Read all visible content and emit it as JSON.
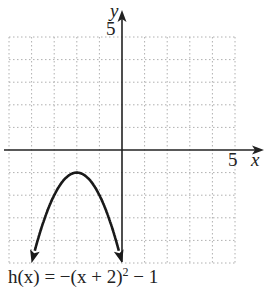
{
  "chart_data": {
    "type": "line",
    "title": "",
    "function_label": "h(x) = −(x + 2)² − 1",
    "xlabel": "x",
    "ylabel": "y",
    "xlim": [
      -5,
      5
    ],
    "ylim": [
      -5,
      5
    ],
    "x_tick_labels": [
      "5"
    ],
    "y_tick_labels": [
      "5"
    ],
    "grid": true,
    "grid_step": 1,
    "series": [
      {
        "name": "h(x) = −(x + 2)² − 1",
        "x": [
          -4,
          -3.5,
          -3,
          -2.5,
          -2,
          -1.5,
          -1,
          -0.5,
          0
        ],
        "y": [
          -5,
          -3.25,
          -2,
          -1.25,
          -1,
          -1.25,
          -2,
          -3.25,
          -5
        ],
        "vertex": [
          -2,
          -1
        ],
        "arrows_at_ends": true
      }
    ],
    "colors": {
      "axis": "#222222",
      "curve": "#1a1a1a",
      "grid": "#aaaaaa"
    }
  },
  "labels": {
    "y_axis": "y",
    "y_tick": "5",
    "x_tick": "5",
    "x_axis": "x",
    "eq_prefix": "h(x) = −(x + 2)",
    "eq_exp": "2",
    "eq_suffix": " − 1"
  }
}
